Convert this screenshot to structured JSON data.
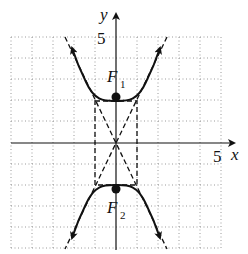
{
  "figure": {
    "type": "hyperbola-graph",
    "equation": "y^2/4 - x^2 = 1",
    "axes": {
      "x_label": "x",
      "y_label": "y",
      "x_tick_label": "5",
      "y_tick_label": "5",
      "range": [
        -5,
        5
      ]
    },
    "foci": [
      {
        "label": "F",
        "subscript": "1",
        "x": 0,
        "y": 2.24
      },
      {
        "label": "F",
        "subscript": "2",
        "x": 0,
        "y": -2.24
      }
    ],
    "vertices": [
      {
        "x": 0,
        "y": 2
      },
      {
        "x": 0,
        "y": -2
      }
    ],
    "asymptotes": [
      "y = 2x",
      "y = -2x"
    ],
    "fundamental_rectangle": {
      "x": [
        -1,
        1
      ],
      "y": [
        -2,
        2
      ]
    },
    "colors": {
      "curve": "#111111",
      "grid": "#9a9a9a",
      "axes": "#111111"
    }
  }
}
